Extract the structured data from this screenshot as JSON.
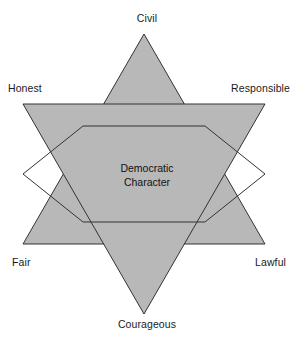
{
  "diagram": {
    "title_center": {
      "line1": "Democratic",
      "line2": "Character"
    },
    "shape": "six-pointed-star",
    "colors": {
      "fill": "#b8b8b8",
      "stroke": "#333333",
      "background": "#ffffff",
      "text": "#1a1a1a"
    },
    "vertices": [
      {
        "id": "civil",
        "label": "Civil",
        "position": "top"
      },
      {
        "id": "responsible",
        "label": "Responsible",
        "position": "upper-right"
      },
      {
        "id": "lawful",
        "label": "Lawful",
        "position": "lower-right"
      },
      {
        "id": "courageous",
        "label": "Courageous",
        "position": "bottom"
      },
      {
        "id": "fair",
        "label": "Fair",
        "position": "lower-left"
      },
      {
        "id": "honest",
        "label": "Honest",
        "position": "upper-left"
      }
    ],
    "geometry": {
      "center_x": 144,
      "center_y": 174,
      "outer_radius": 140,
      "inner_radius": 70,
      "stroke_width": 1
    }
  }
}
